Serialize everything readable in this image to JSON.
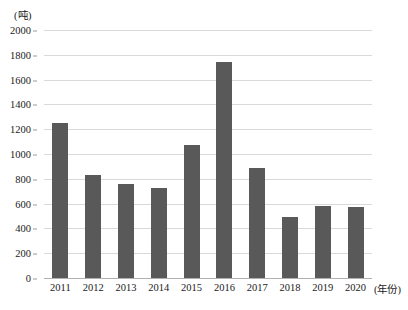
{
  "chart_data": {
    "type": "bar",
    "title": "",
    "subtitle": "",
    "xlabel": "(年份)",
    "ylabel": "(吨)",
    "categories": [
      "2011",
      "2012",
      "2013",
      "2014",
      "2015",
      "2016",
      "2017",
      "2018",
      "2019",
      "2020"
    ],
    "values": [
      1250,
      830,
      760,
      725,
      1075,
      1745,
      890,
      490,
      580,
      570
    ],
    "ylim": [
      0,
      2000
    ],
    "y_ticks": [
      "0",
      "200",
      "400",
      "600",
      "800",
      "1000",
      "1200",
      "1400",
      "1600",
      "1800",
      "2000"
    ],
    "y_tick_values": [
      0,
      200,
      400,
      600,
      800,
      1000,
      1200,
      1400,
      1600,
      1800,
      2000
    ],
    "grid": true,
    "legend": false,
    "legend_position": "none",
    "bar_color": "#595959",
    "gridline_color": "#d9d9d9",
    "background_color": "#ffffff"
  }
}
